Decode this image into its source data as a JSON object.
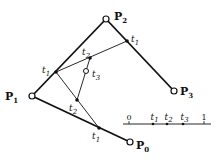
{
  "diagram": {
    "control_points": [
      {
        "name": "P",
        "sub": "0",
        "x": 130,
        "y": 142,
        "lx": 136,
        "ly": 149
      },
      {
        "name": "P",
        "sub": "1",
        "x": 32,
        "y": 96,
        "lx": 5,
        "ly": 100
      },
      {
        "name": "P",
        "sub": "2",
        "x": 106,
        "y": 19,
        "lx": 114,
        "ly": 20
      },
      {
        "name": "P",
        "sub": "3",
        "x": 174,
        "y": 91,
        "lx": 180,
        "ly": 95
      }
    ],
    "level1_points": [
      {
        "label": "t",
        "sub": "1",
        "x": 56,
        "y": 72,
        "lx": 42,
        "ly": 73
      },
      {
        "label": "t",
        "sub": "1",
        "x": 127,
        "y": 41,
        "lx": 131,
        "ly": 42
      },
      {
        "label": "t",
        "sub": "1",
        "x": 99,
        "y": 128,
        "lx": 92,
        "ly": 139
      }
    ],
    "level2_points": [
      {
        "label": "t",
        "sub": "2",
        "x": 90,
        "y": 58,
        "lx": 82,
        "ly": 55
      },
      {
        "label": "t",
        "sub": "2",
        "x": 77,
        "y": 100,
        "lx": 69,
        "ly": 111
      }
    ],
    "result_point": {
      "label": "t",
      "sub": "3",
      "x": 86,
      "y": 71,
      "lx": 92,
      "ly": 77
    },
    "number_line": {
      "x_start": 123,
      "x_end": 211,
      "y": 124,
      "ticks": [
        {
          "label": "0",
          "sub": "",
          "x": 129,
          "marker": "tick"
        },
        {
          "label": "t",
          "sub": "1",
          "x": 153,
          "marker": "dot"
        },
        {
          "label": "t",
          "sub": "2",
          "x": 167,
          "marker": "dot"
        },
        {
          "label": "t",
          "sub": "3",
          "x": 183,
          "marker": "dot"
        },
        {
          "label": "1",
          "sub": "",
          "x": 204,
          "marker": "tick"
        }
      ]
    },
    "colors": {
      "stroke": "#111111",
      "background": "#ffffff"
    }
  }
}
